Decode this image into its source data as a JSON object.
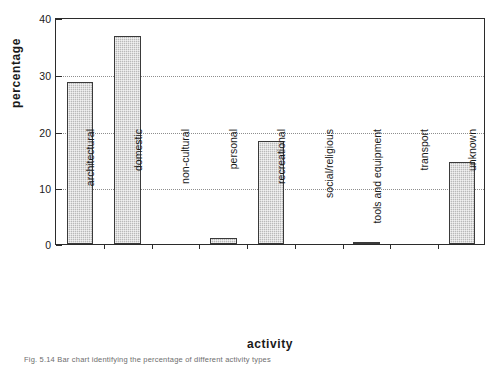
{
  "chart_data": {
    "type": "bar",
    "title": "",
    "xlabel": "activity",
    "ylabel": "percentage",
    "categories": [
      "architectural",
      "domestic",
      "non-cultural",
      "personal",
      "recreational",
      "social/religious",
      "tools and equipment",
      "transport",
      "unknown"
    ],
    "values": [
      28.6,
      36.6,
      0,
      1.0,
      18.1,
      0,
      0.2,
      0,
      14.4
    ],
    "ylim": [
      0,
      40
    ],
    "yticks": [
      0,
      10,
      20,
      30,
      40
    ],
    "ytick_labels": [
      "0",
      "10",
      "20",
      "30",
      "40"
    ],
    "grid": "horizontal-dotted",
    "legend": "none",
    "bar_color": "#b9b9b9",
    "bar_edge_color": "#3a3a3a",
    "axis_color": "#2b2b2b",
    "grid_color": "#8e8e8e"
  },
  "caption": {
    "text": "Fig. 5.14  Bar chart identifying the percentage of different activity types"
  }
}
